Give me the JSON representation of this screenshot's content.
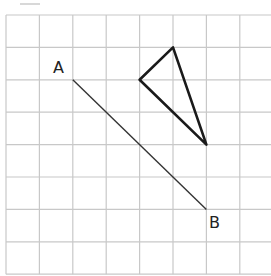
{
  "diagram": {
    "type": "grid-geometry",
    "top_cut_text": "",
    "grid": {
      "origin_x": 6,
      "origin_y": 15,
      "cell_w": 33.4,
      "cell_h": 32.4,
      "cols": 8,
      "rows": 8,
      "line_color": "#c8c8c8"
    },
    "segment": {
      "start_label": "A",
      "end_label": "B",
      "start": [
        2,
        2
      ],
      "end": [
        6,
        6
      ],
      "color": "#333333"
    },
    "triangle": {
      "vertices": [
        [
          5,
          1
        ],
        [
          4,
          2
        ],
        [
          6,
          4
        ]
      ],
      "color": "#1a1a1a"
    },
    "labels": {
      "a": "A",
      "b": "B"
    }
  }
}
